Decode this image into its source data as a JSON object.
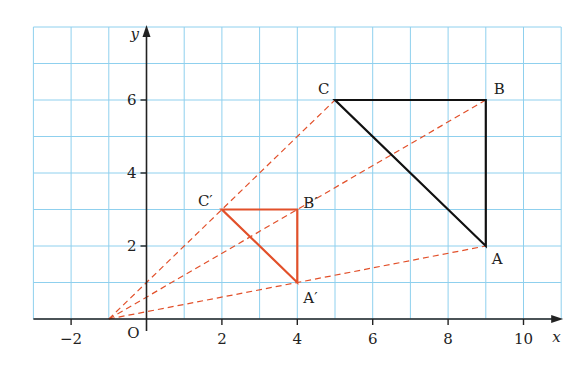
{
  "figure_marker": "3",
  "axes": {
    "x_label": "x",
    "y_label": "y",
    "origin_label": "O",
    "x_ticks": [
      {
        "value": -2,
        "label": "−2"
      },
      {
        "value": 2,
        "label": "2"
      },
      {
        "value": 4,
        "label": "4"
      },
      {
        "value": 6,
        "label": "6"
      },
      {
        "value": 8,
        "label": "8"
      },
      {
        "value": 10,
        "label": "10"
      }
    ],
    "y_ticks": [
      {
        "value": 2,
        "label": "2"
      },
      {
        "value": 4,
        "label": "4"
      },
      {
        "value": 6,
        "label": "6"
      }
    ],
    "x_range": [
      -3,
      11
    ],
    "y_range": [
      0,
      8
    ]
  },
  "colors": {
    "grid": "#8fd0ee",
    "axis": "#222222",
    "object": "#111111",
    "image": "#e2502a",
    "rays": "#e2502a"
  },
  "center": {
    "x": -1,
    "y": 0
  },
  "triangle_ABC": {
    "points": [
      {
        "name": "A",
        "label": "A",
        "x": 9,
        "y": 2
      },
      {
        "name": "B",
        "label": "B",
        "x": 9,
        "y": 6
      },
      {
        "name": "C",
        "label": "C",
        "x": 5,
        "y": 6
      }
    ]
  },
  "triangle_image": {
    "points": [
      {
        "name": "A'",
        "label": "A′",
        "x": 4,
        "y": 1
      },
      {
        "name": "B'",
        "label": "B′",
        "x": 4,
        "y": 3
      },
      {
        "name": "C'",
        "label": "C′",
        "x": 2,
        "y": 3
      }
    ]
  }
}
